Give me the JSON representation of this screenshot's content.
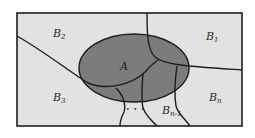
{
  "diagram": {
    "type": "set-partition",
    "colors": {
      "background": "#ffffff",
      "universe_fill": "#e2e2e2",
      "set_A_fill": "#7c7c7c",
      "stroke": "#1e1e1e"
    },
    "set_A": {
      "label": "A"
    },
    "regions": [
      {
        "id": "b1",
        "base": "B",
        "sub": "1"
      },
      {
        "id": "b2",
        "base": "B",
        "sub": "2"
      },
      {
        "id": "b3",
        "base": "B",
        "sub": "3"
      },
      {
        "id": "bn1",
        "base": "B",
        "sub": "n-1"
      },
      {
        "id": "bn",
        "base": "B",
        "sub": "n"
      }
    ],
    "ellipsis": "• • •"
  }
}
